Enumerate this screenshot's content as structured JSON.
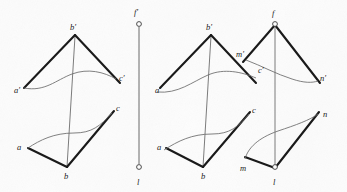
{
  "figure": {
    "type": "technical-line-drawing",
    "width": 347,
    "height": 192,
    "background_color": "#fdfdfd",
    "ink_color": "#1a1a1a",
    "thin_line_color": "#595959"
  },
  "diagrams": [
    {
      "id": "left-diagram",
      "name": "triangle-abc-with-line-l",
      "labels": [
        {
          "id": "b-prime-left",
          "text": "b′",
          "x": 70,
          "y": 23
        },
        {
          "id": "a-prime-left",
          "text": "a′",
          "x": 14,
          "y": 86
        },
        {
          "id": "c-prime-left",
          "text": "c′",
          "x": 119,
          "y": 74
        },
        {
          "id": "a-left",
          "text": "a",
          "x": 17,
          "y": 143
        },
        {
          "id": "b-left",
          "text": "b",
          "x": 64,
          "y": 172
        },
        {
          "id": "c-left",
          "text": "c",
          "x": 116,
          "y": 104
        },
        {
          "id": "f-prime-left",
          "text": "f′",
          "x": 134,
          "y": 8
        },
        {
          "id": "l-left",
          "text": "l",
          "x": 137,
          "y": 178
        }
      ],
      "vertices": {
        "a_prime": [
          24,
          88
        ],
        "b_prime": [
          75,
          35
        ],
        "c_prime": [
          118,
          80
        ],
        "a": [
          28,
          148
        ],
        "b": [
          67,
          167
        ],
        "c": [
          113,
          112
        ],
        "f_prime_point": [
          139,
          23
        ],
        "l_point": [
          139,
          168
        ]
      }
    },
    {
      "id": "right-diagram",
      "name": "triangle-abc-and-triangle-mln-with-line-f",
      "labels": [
        {
          "id": "b-prime-right",
          "text": "b′",
          "x": 206,
          "y": 23
        },
        {
          "id": "a-prime-right",
          "text": "a′",
          "x": 155,
          "y": 86
        },
        {
          "id": "c-prime-right",
          "text": "c′",
          "x": 258,
          "y": 66
        },
        {
          "id": "m-prime-right",
          "text": "m′",
          "x": 236,
          "y": 50
        },
        {
          "id": "f-right",
          "text": "f",
          "x": 272,
          "y": 9
        },
        {
          "id": "n-prime-right",
          "text": "n′",
          "x": 320,
          "y": 74
        },
        {
          "id": "a-right",
          "text": "a",
          "x": 157,
          "y": 143
        },
        {
          "id": "b-right",
          "text": "b",
          "x": 201,
          "y": 172
        },
        {
          "id": "c-right",
          "text": "c",
          "x": 252,
          "y": 106
        },
        {
          "id": "m-right",
          "text": "m",
          "x": 240,
          "y": 164
        },
        {
          "id": "l-right",
          "text": "l",
          "x": 273,
          "y": 178
        },
        {
          "id": "n-right",
          "text": "n",
          "x": 323,
          "y": 110
        }
      ],
      "vertices": {
        "a_prime": [
          165,
          88
        ],
        "b_prime": [
          211,
          35
        ],
        "c_prime": [
          254,
          73
        ],
        "m_prime": [
          247,
          58
        ],
        "f_point": [
          275,
          24
        ],
        "n_prime": [
          318,
          81
        ],
        "a": [
          166,
          148
        ],
        "b": [
          203,
          167
        ],
        "c": [
          249,
          113
        ],
        "m": [
          249,
          158
        ],
        "l_point": [
          275,
          168
        ],
        "n": [
          318,
          114
        ]
      }
    }
  ]
}
